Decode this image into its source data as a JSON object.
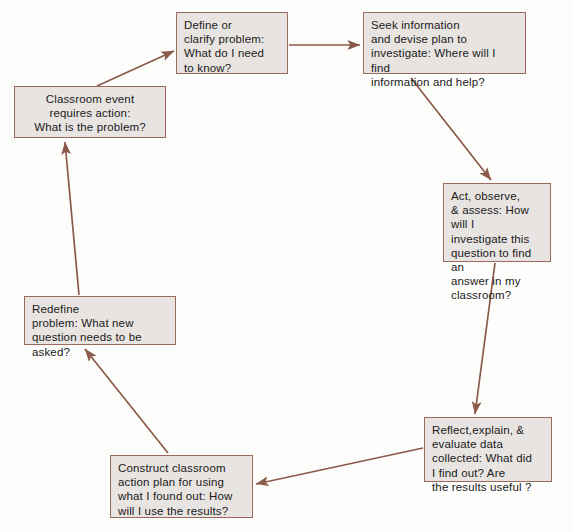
{
  "diagram": {
    "type": "cycle-flowchart",
    "colors": {
      "box_fill": "#e8e4e1",
      "box_border": "#9a6a5c",
      "arrow": "#8b5a4a",
      "page_background": "#fdfdfc",
      "text": "#1a1a1a"
    },
    "nodes": [
      {
        "id": "classroom-event",
        "text": "Classroom event\nrequires action:\nWhat is the problem?",
        "align": "center"
      },
      {
        "id": "define-clarify",
        "text": "Define or\nclarify problem:\nWhat do I need\nto know?",
        "align": "left"
      },
      {
        "id": "seek-information",
        "text": "Seek information\nand devise plan to\ninvestigate: Where will I find\ninformation and help?",
        "align": "left"
      },
      {
        "id": "act-observe-assess",
        "text": "Act, observe,\n& assess: How will I\ninvestigate this\nquestion to find an\nanswer in my\nclassroom?",
        "align": "left"
      },
      {
        "id": "reflect-explain-evaluate",
        "text": "Reflect,explain, &\nevaluate data\ncollected: What did\nI find out? Are\nthe results useful ?",
        "align": "left"
      },
      {
        "id": "construct-action-plan",
        "text": "Construct classroom\naction plan for using\nwhat I found out: How\nwill I use the results?",
        "align": "left"
      },
      {
        "id": "redefine-problem",
        "text": "Redefine\nproblem: What new\nquestion needs to be asked?",
        "align": "left"
      }
    ],
    "edges": [
      {
        "id": "classroom-to-define",
        "from": "classroom-event",
        "to": "define-clarify"
      },
      {
        "id": "define-to-seek",
        "from": "define-clarify",
        "to": "seek-information"
      },
      {
        "id": "seek-to-act",
        "from": "seek-information",
        "to": "act-observe-assess"
      },
      {
        "id": "act-to-reflect",
        "from": "act-observe-assess",
        "to": "reflect-explain-evaluate"
      },
      {
        "id": "reflect-to-construct",
        "from": "reflect-explain-evaluate",
        "to": "construct-action-plan"
      },
      {
        "id": "construct-to-redefine",
        "from": "construct-action-plan",
        "to": "redefine-problem"
      },
      {
        "id": "redefine-to-classroom",
        "from": "redefine-problem",
        "to": "classroom-event"
      }
    ]
  }
}
